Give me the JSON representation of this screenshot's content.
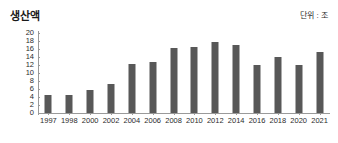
{
  "header": {
    "title": "생산액",
    "unit_label": "단위 : 조"
  },
  "chart_data": {
    "type": "bar",
    "title": "생산액",
    "subtitle": "단위 : 조",
    "xlabel": "",
    "ylabel": "",
    "ylim": [
      0,
      20
    ],
    "yticks": [
      0,
      2,
      4,
      6,
      8,
      10,
      12,
      14,
      16,
      18,
      20
    ],
    "grid": false,
    "legend": false,
    "bar_color": "#585858",
    "categories": [
      "1997",
      "1998",
      "2000",
      "2002",
      "2004",
      "2006",
      "2008",
      "2010",
      "2012",
      "2014",
      "2016",
      "2018",
      "2020",
      "2021"
    ],
    "values": [
      4.5,
      4.6,
      5.8,
      7.3,
      12.3,
      12.8,
      16.2,
      16.5,
      17.8,
      17.0,
      12.0,
      14.0,
      12.0,
      15.2
    ]
  }
}
